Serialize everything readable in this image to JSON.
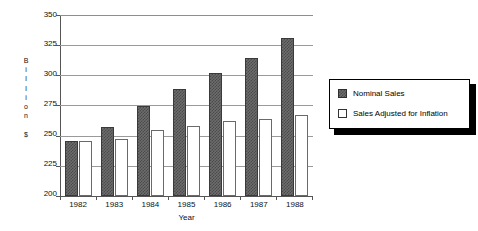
{
  "chart_data": {
    "type": "bar",
    "title": "",
    "xlabel": "Year",
    "ylabel": "Billions $",
    "ylabel_letters": [
      "B",
      "i",
      "l",
      "l",
      "i",
      "o",
      "n",
      "",
      "$"
    ],
    "categories": [
      "1982",
      "1983",
      "1984",
      "1985",
      "1986",
      "1987",
      "1988"
    ],
    "series": [
      {
        "name": "Nominal Sales",
        "swatch": "dark-hatched",
        "color": "#5a5a5a",
        "values": [
          246,
          257,
          275,
          289,
          302,
          314,
          331
        ]
      },
      {
        "name": "Sales Adjusted for Inflation",
        "swatch": "white-outline",
        "color": "#ffffff",
        "values": [
          246,
          247,
          255,
          258,
          262,
          264,
          267
        ]
      }
    ],
    "ylim": [
      200,
      350
    ],
    "ytick_step": 25,
    "yticks": [
      350,
      325,
      300,
      275,
      250,
      225,
      200
    ],
    "ytick_labels": [
      "350",
      "325",
      "300",
      "275",
      "250",
      "225",
      "200"
    ],
    "grid": true,
    "grid_axis": "y",
    "legend_position": "right-outside"
  },
  "legend": {
    "entries": [
      {
        "label": "Nominal Sales"
      },
      {
        "label": "Sales Adjusted for Inflation"
      }
    ]
  }
}
